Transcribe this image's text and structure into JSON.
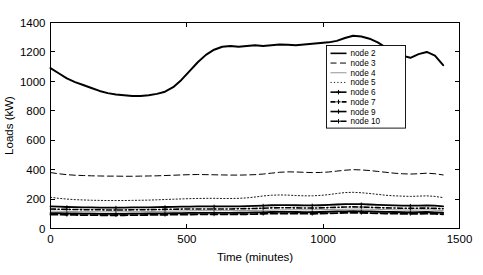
{
  "chart_data": {
    "type": "line",
    "title": "",
    "xlabel": "Time (minutes)",
    "ylabel": "Loads (kW)",
    "xlim": [
      0,
      1500
    ],
    "ylim": [
      0,
      1400
    ],
    "xticks": [
      0,
      500,
      1000,
      1500
    ],
    "yticks": [
      0,
      200,
      400,
      600,
      800,
      1000,
      1200,
      1400
    ],
    "xticklabels": [
      "0",
      "500",
      "1000",
      "1500"
    ],
    "yticklabels": [
      "0",
      "200",
      "400",
      "600",
      "800",
      "1000",
      "1200",
      "1400"
    ],
    "grid": false,
    "legend_position": "upper right",
    "x": [
      0,
      30,
      60,
      90,
      120,
      150,
      180,
      210,
      240,
      270,
      300,
      330,
      360,
      390,
      420,
      450,
      480,
      510,
      540,
      570,
      600,
      630,
      660,
      690,
      720,
      750,
      780,
      810,
      840,
      870,
      900,
      930,
      960,
      990,
      1020,
      1050,
      1080,
      1110,
      1140,
      1170,
      1200,
      1230,
      1260,
      1290,
      1320,
      1350,
      1380,
      1410,
      1440
    ],
    "series": [
      {
        "name": "node 2",
        "style": "solid",
        "linewidth": 2.0,
        "color": "#000000",
        "marker": "none",
        "values": [
          1090,
          1055,
          1020,
          995,
          975,
          955,
          935,
          920,
          910,
          905,
          900,
          900,
          905,
          915,
          930,
          960,
          1010,
          1070,
          1130,
          1180,
          1215,
          1235,
          1240,
          1235,
          1240,
          1245,
          1240,
          1245,
          1250,
          1248,
          1245,
          1250,
          1255,
          1260,
          1265,
          1275,
          1295,
          1310,
          1305,
          1290,
          1265,
          1230,
          1200,
          1175,
          1160,
          1185,
          1200,
          1175,
          1110
        ]
      },
      {
        "name": "node 3",
        "style": "dashed",
        "linewidth": 1.0,
        "color": "#000000",
        "marker": "none",
        "values": [
          380,
          372,
          366,
          362,
          360,
          358,
          357,
          356,
          356,
          355,
          355,
          356,
          357,
          358,
          360,
          362,
          364,
          366,
          367,
          366,
          365,
          364,
          363,
          363,
          364,
          366,
          370,
          376,
          382,
          385,
          384,
          382,
          380,
          381,
          384,
          390,
          396,
          400,
          398,
          394,
          388,
          382,
          376,
          372,
          370,
          372,
          376,
          372,
          364
        ]
      },
      {
        "name": "node 4",
        "style": "solid-thin",
        "linewidth": 0.8,
        "color": "#7a7a7a",
        "marker": "none",
        "values": [
          118,
          117,
          116,
          115,
          114,
          114,
          113,
          113,
          113,
          113,
          114,
          114,
          115,
          116,
          117,
          118,
          119,
          120,
          121,
          121,
          121,
          121,
          121,
          122,
          122,
          123,
          124,
          125,
          126,
          127,
          127,
          127,
          127,
          128,
          129,
          130,
          131,
          132,
          132,
          131,
          130,
          128,
          127,
          126,
          125,
          126,
          127,
          125,
          122
        ]
      },
      {
        "name": "node 5",
        "style": "dotted",
        "linewidth": 0.9,
        "color": "#000000",
        "marker": "none",
        "values": [
          212,
          205,
          200,
          196,
          194,
          192,
          191,
          190,
          190,
          190,
          191,
          192,
          193,
          195,
          197,
          199,
          201,
          203,
          204,
          205,
          205,
          204,
          204,
          205,
          208,
          214,
          221,
          226,
          228,
          227,
          224,
          222,
          222,
          225,
          230,
          238,
          244,
          246,
          243,
          238,
          232,
          226,
          222,
          220,
          218,
          220,
          222,
          218,
          210
        ]
      },
      {
        "name": "node 6",
        "style": "solid-marker",
        "linewidth": 1.8,
        "color": "#000000",
        "marker": "plus",
        "values": [
          150,
          148,
          146,
          145,
          144,
          143,
          142,
          142,
          142,
          142,
          143,
          143,
          144,
          145,
          146,
          147,
          148,
          149,
          150,
          150,
          150,
          150,
          150,
          151,
          152,
          154,
          156,
          158,
          159,
          159,
          158,
          157,
          157,
          158,
          160,
          163,
          165,
          166,
          165,
          163,
          161,
          159,
          157,
          156,
          155,
          156,
          157,
          155,
          151
        ]
      },
      {
        "name": "node 7",
        "style": "dashdot-marker",
        "linewidth": 1.6,
        "color": "#000000",
        "marker": "plus",
        "values": [
          133,
          131,
          130,
          129,
          128,
          127,
          127,
          126,
          126,
          126,
          127,
          127,
          128,
          129,
          130,
          131,
          132,
          133,
          133,
          133,
          133,
          133,
          133,
          134,
          135,
          136,
          138,
          140,
          141,
          141,
          140,
          139,
          139,
          140,
          142,
          144,
          146,
          147,
          146,
          144,
          142,
          140,
          139,
          138,
          137,
          138,
          139,
          137,
          134
        ]
      },
      {
        "name": "node 9",
        "style": "solid-marker2",
        "linewidth": 1.8,
        "color": "#000000",
        "marker": "plus",
        "values": [
          105,
          104,
          103,
          102,
          101,
          101,
          100,
          100,
          100,
          100,
          101,
          101,
          102,
          103,
          103,
          104,
          105,
          106,
          106,
          106,
          106,
          106,
          106,
          107,
          108,
          109,
          110,
          112,
          113,
          113,
          112,
          111,
          111,
          112,
          114,
          116,
          117,
          118,
          117,
          116,
          114,
          113,
          112,
          111,
          110,
          111,
          112,
          110,
          107
        ]
      },
      {
        "name": "node 10",
        "style": "dashed-marker",
        "linewidth": 1.8,
        "color": "#000000",
        "marker": "plus",
        "values": [
          95,
          94,
          93,
          92,
          91,
          91,
          90,
          90,
          90,
          90,
          91,
          91,
          92,
          92,
          93,
          94,
          95,
          95,
          96,
          96,
          96,
          96,
          96,
          97,
          97,
          98,
          100,
          101,
          102,
          102,
          101,
          101,
          100,
          101,
          103,
          105,
          106,
          107,
          106,
          105,
          103,
          102,
          101,
          100,
          100,
          100,
          101,
          99,
          97
        ]
      }
    ]
  },
  "legend": {
    "items": [
      {
        "label": "node 2"
      },
      {
        "label": "node 3"
      },
      {
        "label": "node 4"
      },
      {
        "label": "node 5"
      },
      {
        "label": "node 6"
      },
      {
        "label": "node 7"
      },
      {
        "label": "node 9"
      },
      {
        "label": "node 10"
      }
    ]
  }
}
